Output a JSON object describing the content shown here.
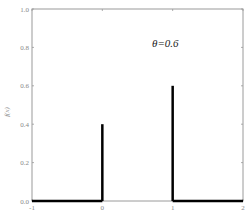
{
  "chart_data": {
    "type": "bar",
    "subtype": "stem / probability mass function",
    "title": "",
    "annotation": "θ=0.6",
    "xlabel": "",
    "ylabel": "f(x)",
    "xlim": [
      -1,
      2
    ],
    "ylim": [
      0,
      1.0
    ],
    "x_ticks": [
      "-1",
      "0",
      "1",
      "2"
    ],
    "y_ticks": [
      "0.0",
      "0.2",
      "0.4",
      "0.6",
      "0.8",
      "1.0"
    ],
    "grid": false,
    "legend": null,
    "categories": [
      "0",
      "1"
    ],
    "values": [
      0.4,
      0.6
    ],
    "baseline_segments": [
      {
        "from": -1,
        "to": 0,
        "value": 0
      },
      {
        "from": 1,
        "to": 2,
        "value": 0
      }
    ]
  }
}
